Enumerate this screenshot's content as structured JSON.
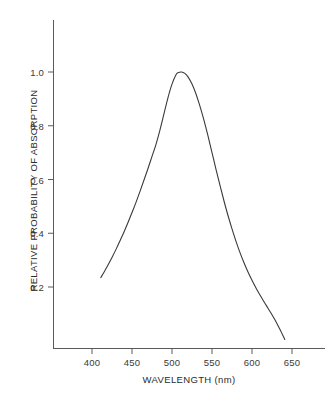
{
  "chart_data": {
    "type": "line",
    "title": "",
    "subtitle": "",
    "xlabel": "WAVELENGTH (nm)",
    "ylabel": "RELATIVE PROBABILITY OF ABSORPTION",
    "xlim": [
      375,
      680
    ],
    "ylim": [
      0.0,
      1.12
    ],
    "xticks": [
      400,
      450,
      500,
      550,
      600,
      650
    ],
    "xtick_labels": [
      "400",
      "450",
      "500",
      "550",
      "600",
      "650"
    ],
    "yticks": [
      0.2,
      0.4,
      0.6,
      0.8,
      1.0
    ],
    "ytick_labels": [
      "0.2",
      "0.4",
      "0.6",
      "0.8",
      "1.0"
    ],
    "grid": false,
    "legend": null,
    "annotations": [],
    "line_color": "#3a3a3a",
    "line_width": 1.1,
    "axis_color": "#5a5a5a",
    "background": "#ffffff",
    "peak_x": 512,
    "peak_y": 1.0,
    "series": [
      {
        "name": "absorption",
        "x": [
          411,
          415,
          420,
          425,
          430,
          435,
          440,
          445,
          450,
          455,
          460,
          465,
          470,
          475,
          480,
          485,
          490,
          495,
          500,
          505,
          508,
          512,
          516,
          520,
          525,
          530,
          535,
          540,
          545,
          550,
          555,
          560,
          565,
          570,
          575,
          580,
          585,
          590,
          595,
          600,
          605,
          610,
          615,
          620,
          625,
          630,
          635,
          641
        ],
        "y": [
          0.235,
          0.255,
          0.282,
          0.31,
          0.34,
          0.372,
          0.405,
          0.44,
          0.477,
          0.515,
          0.556,
          0.598,
          0.641,
          0.686,
          0.731,
          0.785,
          0.845,
          0.905,
          0.955,
          0.99,
          0.998,
          1.0,
          0.995,
          0.982,
          0.955,
          0.918,
          0.872,
          0.82,
          0.762,
          0.7,
          0.638,
          0.578,
          0.52,
          0.466,
          0.416,
          0.37,
          0.328,
          0.29,
          0.256,
          0.225,
          0.196,
          0.17,
          0.145,
          0.121,
          0.097,
          0.071,
          0.042,
          0.005
        ]
      }
    ]
  },
  "axes": {
    "y_axis_name": "y-axis",
    "x_axis_name": "x-axis"
  }
}
